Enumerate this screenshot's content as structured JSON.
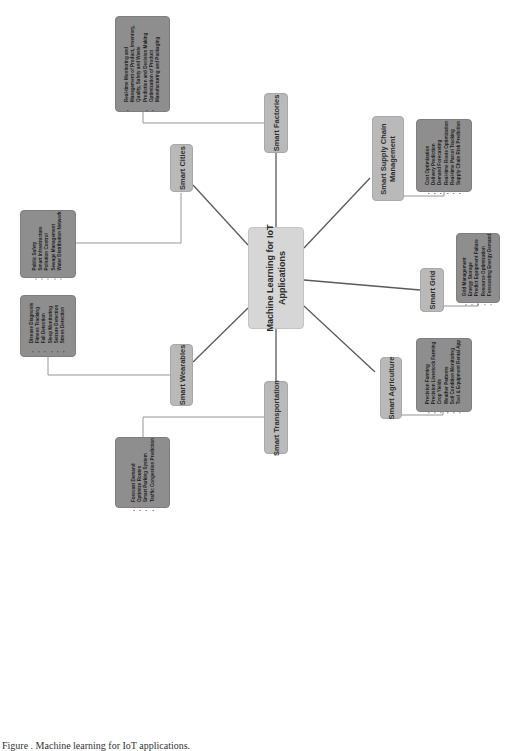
{
  "diagram": {
    "type": "mind-map",
    "orientation": "rotated 90 degrees counter-clockwise",
    "center": {
      "line1": "Machine Learning for IoT",
      "line2": "Applications"
    },
    "branches": [
      {
        "label": "Smart Factories",
        "items": [
          "Real-time Monitoring and Management of Product, Inventory, Quality, Safety and Waste",
          "Prediction and Decision Making",
          "Optimization of Product Manufacturing and Packaging"
        ]
      },
      {
        "label_line1": "Smart Supply Chain",
        "label_line2": "Management",
        "items": [
          "Cost Optimization",
          "Delivery Prediction",
          "Demand Forecasting",
          "Real-time Route Optimization",
          "Real-time Parcel Tracking",
          "Supply Chain Risk Prediction"
        ]
      },
      {
        "label": "Smart Grid",
        "items": [
          "Grid Management",
          "Energy Storage",
          "Predict Equipment Failure",
          "Resource Optimization",
          "Forecasting Energy Demand"
        ]
      },
      {
        "label": "Smart Agriculture",
        "items": [
          "Precision Farming",
          "Precision Livestock Farming",
          "Crop Yields",
          "Weather Patterns",
          "Soil Condition Monitoring",
          "Tool & Equipment Rental App"
        ]
      },
      {
        "label": "Smart Transportation",
        "items": [
          "Forecast Demand",
          "Optimize Routes",
          "Smart Parking System",
          "Traffic Congestion Prediction"
        ]
      },
      {
        "label": "Smart Wearables",
        "items": [
          "Disease Diagnosis",
          "Fitness Tracking",
          "Fall Detection",
          "Sleep Monitoring",
          "Seizure Detection",
          "Stress Detection"
        ]
      },
      {
        "label": "Smart Cities",
        "items": [
          "Public Safety",
          "Smart Infrastructure",
          "Pollution Control",
          "Sewage Management",
          "Water Distribution Network"
        ]
      }
    ],
    "colors": {
      "center_fill": "#d6d6d6",
      "category_fill": "#b9b9b9",
      "items_fill": "#8e8e8e",
      "spoke_line": "#555555",
      "connector_line": "#888888"
    }
  },
  "caption": "Figure . Machine learning for IoT applications."
}
